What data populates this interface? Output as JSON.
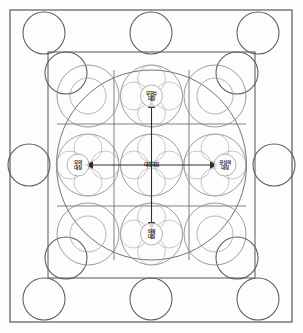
{
  "diagram": {
    "canvas": {
      "width": 303,
      "height": 333
    },
    "frames": {
      "outer": {
        "x": 10,
        "y": 10,
        "width": 282,
        "height": 312,
        "color": "#4a4a4a"
      },
      "inner": {
        "x": 48,
        "y": 52,
        "width": 207,
        "height": 226,
        "color": "#555555"
      }
    },
    "enclosing_circle": {
      "cx": 151.5,
      "cy": 165,
      "r": 95,
      "color": "#6b6b6b"
    },
    "grid": {
      "columns": 3,
      "rows": 3,
      "vertical_lines": [
        114,
        189
      ],
      "horizontal_lines": [
        124,
        206
      ],
      "color": "#6a6a6a"
    },
    "band_circles": {
      "radius": 21,
      "color": "#5a5a5a",
      "positions": [
        {
          "name": "top-left",
          "cx": 44,
          "cy": 33
        },
        {
          "name": "top-center",
          "cx": 151,
          "cy": 33
        },
        {
          "name": "top-right",
          "cx": 258,
          "cy": 33
        },
        {
          "name": "middle-left",
          "cx": 29,
          "cy": 165
        },
        {
          "name": "middle-right",
          "cx": 274,
          "cy": 165
        },
        {
          "name": "bottom-left",
          "cx": 44,
          "cy": 299
        },
        {
          "name": "bottom-center",
          "cx": 151,
          "cy": 299
        },
        {
          "name": "bottom-right",
          "cx": 258,
          "cy": 299
        }
      ]
    },
    "cell_circles": {
      "radius": 31,
      "color": "#8a8a8a",
      "note": "one circle inscribed in each of the nine grid cells"
    },
    "labels": [
      {
        "id": "north",
        "line1": "무한수",
        "line2": "대칭",
        "x": 151.5,
        "y": 96,
        "direction": "up"
      },
      {
        "id": "west",
        "line1": "부의",
        "line2": "대칭",
        "x": 78,
        "y": 165,
        "direction": "left"
      },
      {
        "id": "center",
        "line1": "대칭대칭",
        "line2": "",
        "x": 151.5,
        "y": 165,
        "direction": "none"
      },
      {
        "id": "east",
        "line1": "공성의",
        "line2": "대칭",
        "x": 225,
        "y": 165,
        "direction": "right"
      },
      {
        "id": "south",
        "line1": "아래",
        "line2": "대칭",
        "x": 151.5,
        "y": 234,
        "direction": "down"
      }
    ],
    "arrows": [
      {
        "id": "arrow-up",
        "x1": 151.5,
        "y1": 165,
        "x2": 151.5,
        "y2": 103,
        "color": "#2d2d2d"
      },
      {
        "id": "arrow-down",
        "x1": 151.5,
        "y1": 165,
        "x2": 151.5,
        "y2": 227,
        "color": "#2d2d2d"
      },
      {
        "id": "arrow-left",
        "x1": 151.5,
        "y1": 165,
        "x2": 88,
        "y2": 165,
        "color": "#2d2d2d"
      },
      {
        "id": "arrow-right",
        "x1": 151.5,
        "y1": 165,
        "x2": 215,
        "y2": 165,
        "color": "#2d2d2d"
      }
    ],
    "colors": {
      "background": "#fdfdfd",
      "frame": "#4a4a4a",
      "grid": "#6a6a6a",
      "circle_outline": "#8a8a8a",
      "arrow": "#2d2d2d",
      "text": "#1f1f1f"
    }
  }
}
